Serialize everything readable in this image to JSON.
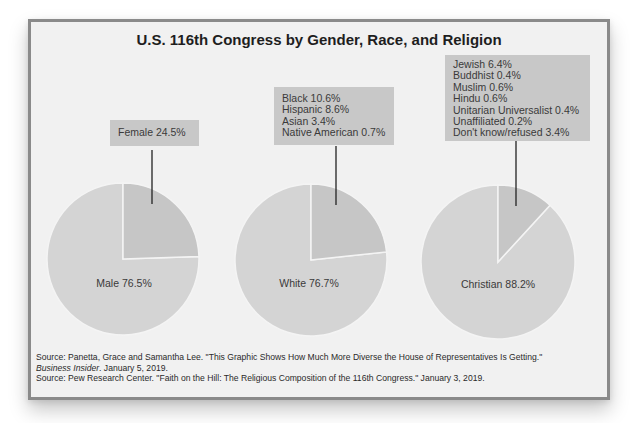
{
  "chart_data": [
    {
      "type": "pie",
      "title": "U.S. 116th Congress by Gender, Race, and Religion",
      "subtitle": "Gender",
      "categories": [
        "Female",
        "Male"
      ],
      "values": [
        24.5,
        76.5
      ],
      "labels": [
        "Female 24.5%",
        "Male 76.5%"
      ],
      "callout": [
        "Female 24.5%"
      ],
      "colors": [
        "#c6c6c6",
        "#d4d4d4"
      ]
    },
    {
      "type": "pie",
      "subtitle": "Race",
      "categories": [
        "Black",
        "Hispanic",
        "Asian",
        "Native American",
        "White"
      ],
      "values": [
        10.6,
        8.6,
        3.4,
        0.7,
        76.7
      ],
      "labels": [
        "Black 10.6%",
        "Hispanic 8.6%",
        "Asian 3.4%",
        "Native American 0.7%",
        "White 76.7%"
      ],
      "grouped_slice": {
        "label_lines": [
          "Black 10.6%",
          "Hispanic 8.6%",
          "Asian 3.4%",
          "Native American 0.7%"
        ],
        "total": 23.3
      },
      "colors": [
        "#c6c6c6",
        "#d4d4d4"
      ]
    },
    {
      "type": "pie",
      "subtitle": "Religion",
      "categories": [
        "Jewish",
        "Buddhist",
        "Muslim",
        "Hindu",
        "Unitarian Universalist",
        "Unaffiliated",
        "Don't know/refused",
        "Christian"
      ],
      "values": [
        6.4,
        0.4,
        0.6,
        0.6,
        0.4,
        0.2,
        3.4,
        88.2
      ],
      "labels": [
        "Jewish 6.4%",
        "Buddhist 0.4%",
        "Muslim 0.6%",
        "Hindu 0.6%",
        "Unitarian Universalist 0.4%",
        "Unaffiliated 0.2%",
        "Don't know/refused 3.4%",
        "Christian 88.2%"
      ],
      "grouped_slice": {
        "label_lines": [
          "Jewish 6.4%",
          "Buddhist 0.4%",
          "Muslim 0.6%",
          "Hindu 0.6%",
          "Unitarian Universalist 0.4%",
          "Unaffiliated 0.2%",
          "Don't know/refused 3.4%"
        ],
        "total": 11.8
      },
      "colors": [
        "#c6c6c6",
        "#d4d4d4"
      ]
    }
  ],
  "figure": {
    "title": "U.S. 116th Congress by Gender, Race, and Religion",
    "gender": {
      "callout": [
        "Female 24.5%"
      ],
      "main_label": "Male 76.5%",
      "minor_pct": 24.5
    },
    "race": {
      "callout": [
        "Black 10.6%",
        "Hispanic 8.6%",
        "Asian 3.4%",
        "Native American 0.7%"
      ],
      "main_label": "White 76.7%",
      "minor_pct": 23.3
    },
    "religion": {
      "callout": [
        "Jewish 6.4%",
        "Buddhist 0.4%",
        "Muslim 0.6%",
        "Hindu 0.6%",
        "Unitarian Universalist 0.4%",
        "Unaffiliated 0.2%",
        "Don't know/refused 3.4%"
      ],
      "main_label": "Christian 88.2%",
      "minor_pct": 11.8
    },
    "sources": {
      "line1": "Source: Panetta, Grace and Samantha Lee. \"This Graphic Shows How Much More Diverse the House of Representatives Is Getting.\"",
      "line2_italic": "Business Insider",
      "line2_rest": ". January 5, 2019.",
      "line3": "Source: Pew Research Center. \"Faith on the Hill: The Religious Composition of the 116th Congress.\" January 3, 2019."
    },
    "colors": {
      "background": "#f1f1f1",
      "frame_border": "#8a8a8a",
      "major_slice": "#d4d4d4",
      "minor_slice": "#c6c6c6",
      "callout_box": "#c8c8c8",
      "leader_line": "#222222"
    }
  }
}
